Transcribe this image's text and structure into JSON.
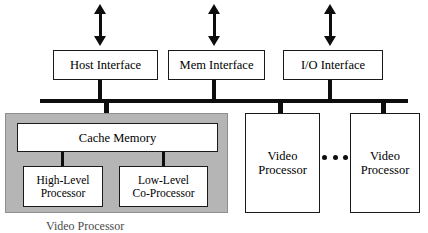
{
  "diagram": {
    "colors": {
      "panel_gray": "#b5b5b5",
      "line_black": "#0d0d0d",
      "box_fill": "#ffffff",
      "box_border": "#1a1a1a"
    },
    "interfaces": [
      {
        "id": "host",
        "label": "Host Interface",
        "arrow": "double-headed-vertical-arrow"
      },
      {
        "id": "mem",
        "label": "Mem Interface",
        "arrow": "double-headed-vertical-arrow"
      },
      {
        "id": "io",
        "label": "I/O  Interface",
        "arrow": "double-headed-vertical-arrow"
      }
    ],
    "bus": {
      "name": "system-bus"
    },
    "subsystem": {
      "cache": {
        "label": "Cache Memory"
      },
      "processors": [
        {
          "id": "high",
          "line1": "High-Level",
          "line2": "Processor"
        },
        {
          "id": "low",
          "line1": "Low-Level",
          "line2": "Co-Processor"
        }
      ]
    },
    "video_processors": [
      {
        "id": "vp1",
        "line1": "Video",
        "line2": "Processor"
      },
      {
        "id": "vp2",
        "line1": "Video",
        "line2": "Processor"
      }
    ],
    "ellipsis": "• • •",
    "caption": "Video Processor"
  }
}
